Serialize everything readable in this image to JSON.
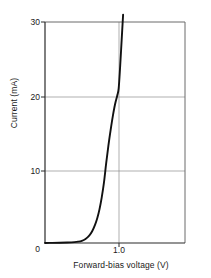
{
  "chart_data": {
    "type": "line",
    "title": "",
    "xlabel": "Forward-bias voltage (V)",
    "ylabel": "Current (mA)",
    "xlim": [
      0,
      1.9
    ],
    "ylim": [
      0,
      30
    ],
    "grid": true,
    "legend": null,
    "xticks": [
      {
        "value": 0,
        "label": "0"
      },
      {
        "value": 1.0,
        "label": "1.0"
      }
    ],
    "yticks": [
      {
        "value": 0,
        "label": "0"
      },
      {
        "value": 10,
        "label": "10"
      },
      {
        "value": 20,
        "label": "20"
      },
      {
        "value": 30,
        "label": "30"
      }
    ],
    "gridlines": {
      "horizontal": [
        10,
        20
      ],
      "vertical": [
        1.0
      ]
    },
    "series": [
      {
        "name": "Forward-bias I-V characteristic",
        "color": "#111111",
        "x": [
          0.0,
          0.1,
          0.2,
          0.3,
          0.4,
          0.45,
          0.5,
          0.55,
          0.6,
          0.64,
          0.68,
          0.71,
          0.74,
          0.77,
          0.8,
          0.83,
          0.86,
          0.89,
          0.92,
          0.95,
          0.98,
          1.0,
          1.02,
          1.04,
          1.06
        ],
        "y": [
          0.0,
          0.02,
          0.04,
          0.07,
          0.12,
          0.18,
          0.3,
          0.55,
          1.0,
          1.6,
          2.5,
          3.4,
          4.6,
          6.2,
          8.2,
          10.8,
          13.2,
          15.3,
          17.2,
          18.8,
          20.0,
          21.0,
          24.0,
          27.5,
          31.0
        ]
      }
    ]
  },
  "axis_titles": {
    "y": "Current (mA)",
    "x": "Forward-bias voltage (V)"
  }
}
